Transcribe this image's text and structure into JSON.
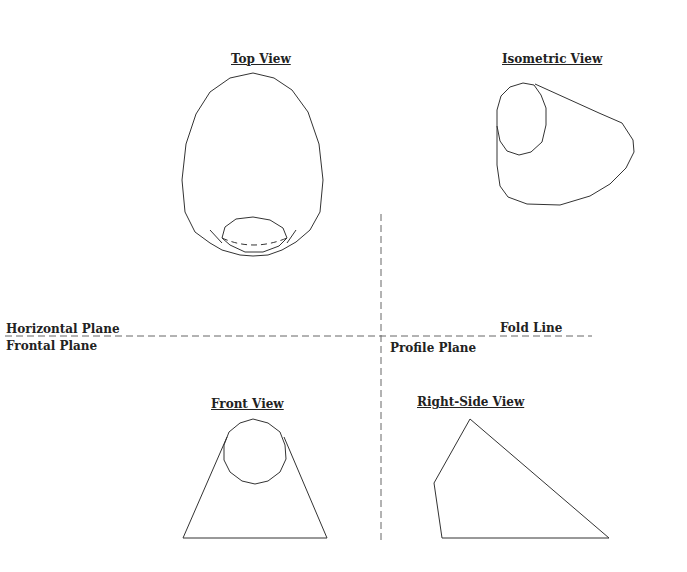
{
  "views": {
    "top": {
      "title": "Top View"
    },
    "isometric": {
      "title": "Isometric View"
    },
    "front": {
      "title": "Front View"
    },
    "right_side": {
      "title": "Right-Side View"
    }
  },
  "planes": {
    "horizontal": "Horizontal Plane",
    "frontal": "Frontal Plane",
    "profile": "Profile Plane",
    "fold_line": "Fold Line"
  },
  "colors": {
    "line": "#333333",
    "dash": "#555555",
    "background": "#ffffff"
  }
}
